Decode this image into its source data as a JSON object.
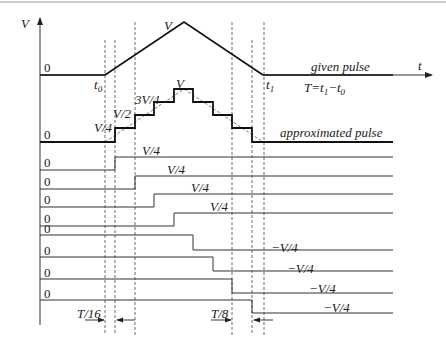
{
  "axis": {
    "y_label": "V",
    "x_label": "t",
    "zero": "0"
  },
  "given_pulse": {
    "label": "given pulse",
    "peak_label": "V",
    "t0_label": "t",
    "t0_sub": "0",
    "t1_label": "t",
    "t1_sub": "1",
    "period_label_T": "T=t",
    "period_label_sub1": "1",
    "period_label_minus": "−t",
    "period_label_sub0": "0",
    "points": [
      [
        40,
        75
      ],
      [
        105,
        75
      ],
      [
        184,
        22
      ],
      [
        263,
        75
      ],
      [
        393,
        75
      ]
    ]
  },
  "approximated_pulse": {
    "label": "approximated pulse",
    "zero": "0",
    "step_labels": [
      "V/4",
      "V/2",
      "3V/4",
      "V"
    ],
    "levels_y": [
      142,
      128,
      115,
      102,
      89
    ],
    "step_x": [
      115,
      135,
      154,
      174,
      193,
      213,
      232,
      252
    ]
  },
  "component_steps": [
    {
      "zero": "0",
      "label": "V/4",
      "y_low": 170,
      "y_high": 157,
      "x": 115,
      "direction": "up"
    },
    {
      "zero": "0",
      "label": "V/4",
      "y_low": 189,
      "y_high": 176,
      "x": 135,
      "direction": "up"
    },
    {
      "zero": "0",
      "label": "V/4",
      "y_low": 207,
      "y_high": 194,
      "x": 154,
      "direction": "up"
    },
    {
      "zero": "0",
      "label": "V/4",
      "y_low": 226,
      "y_high": 213,
      "x": 174,
      "direction": "up"
    },
    {
      "zero": "0",
      "label": "−V/4",
      "y_low": 250,
      "y_high": 235,
      "x": 193,
      "direction": "down"
    },
    {
      "zero": "0",
      "label": "−V/4",
      "y_low": 271,
      "y_high": 257,
      "x": 213,
      "direction": "down"
    },
    {
      "zero": "0",
      "label": "−V/4",
      "y_low": 293,
      "y_high": 279,
      "x": 232,
      "direction": "down"
    },
    {
      "zero": "0",
      "label": "−V/4",
      "y_low": 313,
      "y_high": 300,
      "x": 252,
      "direction": "down"
    }
  ],
  "dashed_guides_x": [
    105,
    115,
    135,
    232,
    252,
    264
  ],
  "annotations": {
    "t16": "T/16",
    "t8": "T/8"
  }
}
